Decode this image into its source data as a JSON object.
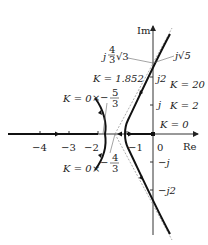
{
  "axes": {
    "real_label": "Re",
    "imag_label": "Im",
    "real_ticks": [
      {
        "value": -4,
        "label": "−4"
      },
      {
        "value": -3,
        "label": "−3"
      },
      {
        "value": -2,
        "label": "−2"
      },
      {
        "value": -1,
        "label": "−1"
      },
      {
        "value": 0,
        "label": "0"
      }
    ],
    "imag_ticks": [
      {
        "value": 2,
        "label": "j2"
      },
      {
        "value": 1,
        "label": "j"
      },
      {
        "value": -1,
        "label": "−j"
      },
      {
        "value": -2,
        "label": "−j2"
      }
    ]
  },
  "annotations": {
    "k_0_pole_upper": "K = 0",
    "k_0_pole_lower": "K = 0",
    "k_0_origin": "K = 0",
    "k_breakaway": "K = 1.852",
    "k_20": "K = 20",
    "k_2": "K = 2",
    "minus_five_thirds_num": "5",
    "minus_five_thirds_den": "3",
    "minus_four_thirds_num": "4",
    "minus_four_thirds_den": "3",
    "j_four_thirds_sqrt3_prefix": "j",
    "j_four_thirds_sqrt3_num": "4",
    "j_four_thirds_sqrt3_den": "3",
    "j_four_thirds_sqrt3_root": "√3",
    "j_sqrt5": "j√5"
  },
  "colors": {
    "locus": "#111111",
    "axis": "#333333",
    "asymptote": "#888888",
    "leader": "#666666"
  }
}
